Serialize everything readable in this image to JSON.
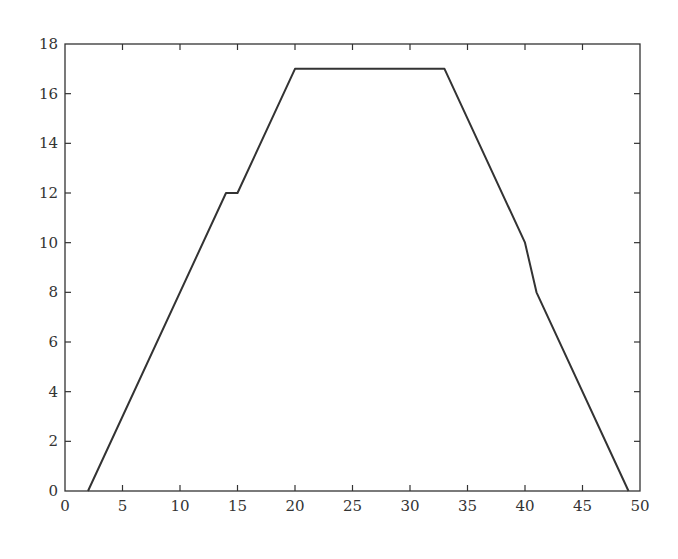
{
  "chart_data": {
    "type": "line",
    "title": "",
    "xlabel": "",
    "ylabel": "",
    "xlim": [
      0,
      50
    ],
    "ylim": [
      0,
      18
    ],
    "xticks": [
      0,
      5,
      10,
      15,
      20,
      25,
      30,
      35,
      40,
      45,
      50
    ],
    "yticks": [
      0,
      2,
      4,
      6,
      8,
      10,
      12,
      14,
      16,
      18
    ],
    "grid": false,
    "legend": null,
    "series": [
      {
        "name": "series-1",
        "color": "#333333",
        "x": [
          2,
          14,
          15,
          20,
          33,
          40,
          41,
          49
        ],
        "y": [
          0,
          12,
          12,
          17,
          17,
          10,
          8,
          0
        ]
      }
    ]
  },
  "colors": {
    "axis": "#333333",
    "line": "#333333",
    "background": "#ffffff"
  }
}
